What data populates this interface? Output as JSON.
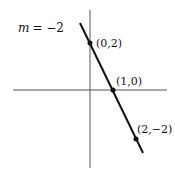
{
  "diagram": {
    "slope_label": "m = −2",
    "slope_var": "m",
    "slope_value": "= −2",
    "points": [
      {
        "label": "(0,2)",
        "x": 0,
        "y": 2
      },
      {
        "label": "(1,0)",
        "x": 1,
        "y": 0
      },
      {
        "label": "(2,−2)",
        "x": 2,
        "y": -2
      }
    ],
    "line": {
      "slope": -2,
      "intercept": 2,
      "color": "#111111"
    },
    "axes_color": "#555555"
  }
}
